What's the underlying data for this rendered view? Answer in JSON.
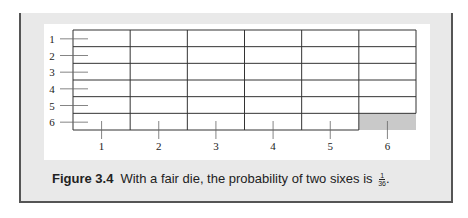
{
  "figure": {
    "row_labels": [
      "1",
      "2",
      "3",
      "4",
      "5",
      "6"
    ],
    "column_labels": [
      "1",
      "2",
      "3",
      "4",
      "5",
      "6"
    ],
    "shaded_cell": {
      "row": 6,
      "column": 6
    },
    "colors": {
      "grid_line": "#333333",
      "shaded": "#c9c9c9",
      "frame_bg": "#e9e9e9",
      "frame_border": "#555555"
    }
  },
  "caption": {
    "label": "Figure 3.4",
    "text": "With a fair die, the probability of two sixes is",
    "fraction_numerator": "1",
    "fraction_denominator": "36",
    "trailing": "."
  }
}
